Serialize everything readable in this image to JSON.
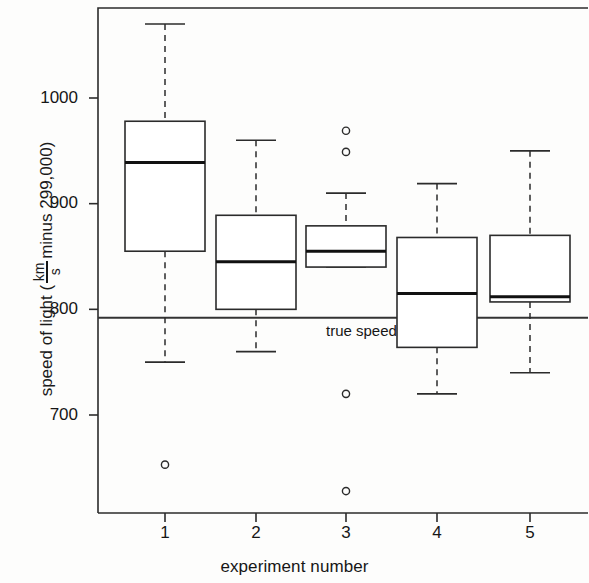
{
  "chart_data": {
    "type": "box",
    "title": "",
    "xlabel": "experiment number",
    "ylabel_parts": {
      "prefix": "speed of light (",
      "numerator": "km",
      "denominator": "s",
      "suffix": " minus 299,000)"
    },
    "ylabel": "speed of light ( km / s minus 299,000)",
    "categories": [
      "1",
      "2",
      "3",
      "4",
      "5"
    ],
    "ytick_labels": [
      "1000",
      "900",
      "800",
      "700"
    ],
    "ytick_values": [
      1000,
      900,
      800,
      700
    ],
    "ylim": [
      620,
      1082
    ],
    "xlim": [
      0.5,
      5.6
    ],
    "grid": false,
    "legend": false,
    "reference_line": {
      "label": "true speed",
      "value": 792,
      "color": "#333333"
    },
    "boxes": [
      {
        "category": "1",
        "whisker_low": 750,
        "q1": 855,
        "median": 939,
        "q3": 978,
        "whisker_high": 1070,
        "outliers": [
          653
        ]
      },
      {
        "category": "2",
        "whisker_low": 760,
        "q1": 800,
        "median": 845,
        "q3": 889,
        "whisker_high": 960,
        "outliers": []
      },
      {
        "category": "3",
        "whisker_low": 840,
        "q1": 840,
        "median": 855,
        "q3": 879,
        "whisker_high": 910,
        "outliers": [
          969,
          949,
          720,
          628
        ]
      },
      {
        "category": "4",
        "whisker_low": 720,
        "q1": 764,
        "median": 815,
        "q3": 868,
        "whisker_high": 919,
        "outliers": []
      },
      {
        "category": "5",
        "whisker_low": 740,
        "q1": 807,
        "median": 812,
        "q3": 870,
        "whisker_high": 950,
        "outliers": []
      }
    ],
    "colors": {
      "line": "#2b2b2b",
      "median": "#111111",
      "box_fill": "#ffffff",
      "background": "#fdfdfc"
    }
  }
}
